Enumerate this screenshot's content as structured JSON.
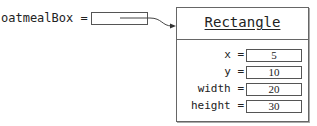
{
  "variable": {
    "name": "oatmealBox",
    "operator": "="
  },
  "object": {
    "class_name": "Rectangle",
    "fields": [
      {
        "name": "x",
        "operator": "=",
        "value": "5"
      },
      {
        "name": "y",
        "operator": "=",
        "value": "10"
      },
      {
        "name": "width",
        "operator": "=",
        "value": "20"
      },
      {
        "name": "height",
        "operator": "=",
        "value": "30"
      }
    ]
  },
  "colors": {
    "line": "#555555",
    "text": "#222222",
    "background": "#ffffff"
  }
}
